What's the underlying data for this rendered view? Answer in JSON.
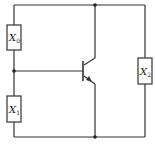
{
  "diagram": {
    "type": "circuit",
    "components": [
      {
        "id": "X0",
        "label": "X",
        "subscript": "0",
        "kind": "box"
      },
      {
        "id": "X1",
        "label": "X",
        "subscript": "1",
        "kind": "box"
      },
      {
        "id": "X2",
        "label": "X",
        "subscript": "2",
        "kind": "box"
      },
      {
        "id": "T",
        "kind": "npn-transistor"
      }
    ],
    "colors": {
      "line": "#333333",
      "background": "#ffffff"
    }
  }
}
